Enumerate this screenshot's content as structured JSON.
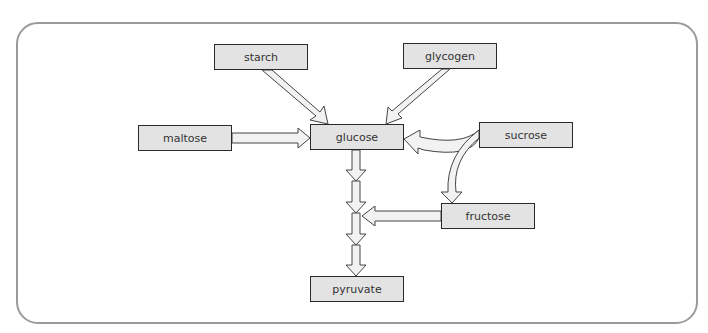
{
  "diagram": {
    "type": "metabolic-pathway",
    "nodes": {
      "starch": "starch",
      "glycogen": "glycogen",
      "maltose": "maltose",
      "glucose": "glucose",
      "sucrose": "sucrose",
      "fructose": "fructose",
      "pyruvate": "pyruvate"
    },
    "edges": [
      {
        "from": "starch",
        "to": "glucose"
      },
      {
        "from": "glycogen",
        "to": "glucose"
      },
      {
        "from": "maltose",
        "to": "glucose"
      },
      {
        "from": "sucrose",
        "to": "glucose"
      },
      {
        "from": "sucrose",
        "to": "fructose"
      },
      {
        "from": "fructose",
        "to": "glucose-pyruvate-pathway"
      },
      {
        "from": "glucose",
        "to": "pyruvate",
        "steps": 4
      }
    ],
    "colors": {
      "node_fill": "#e3e3e3",
      "node_border": "#2a2a2a",
      "arrow_fill": "#f2f2f2",
      "frame": "#9a9a9a"
    }
  }
}
